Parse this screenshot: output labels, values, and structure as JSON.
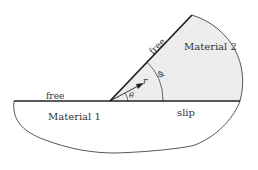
{
  "diagram": {
    "labels": {
      "material1": "Material 1",
      "material2": "Material 2",
      "free_left": "free",
      "free_incline": "free",
      "slip": "slip",
      "r": "r",
      "theta": "θ",
      "phi": "φ"
    },
    "colors": {
      "material2_fill": "#ededed",
      "line": "#222222",
      "text": "#333333"
    }
  }
}
